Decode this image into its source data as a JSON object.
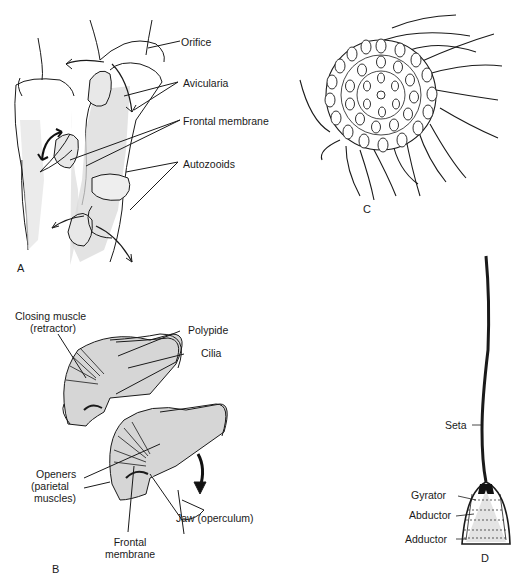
{
  "figure": {
    "panels": [
      {
        "id": "A",
        "letter": "A",
        "labels": {
          "orifice": "Orifice",
          "avicularia": "Avicularia",
          "frontal_membrane": "Frontal membrane",
          "autozooids": "Autozooids"
        }
      },
      {
        "id": "B",
        "letter": "B",
        "labels": {
          "closing_muscle_1": "Closing muscle",
          "closing_muscle_2": "(retractor)",
          "polypide": "Polypide",
          "cilia": "Cilia",
          "openers_1": "Openers",
          "openers_2": "(parietal",
          "openers_3": "muscles)",
          "frontal_membrane_1": "Frontal",
          "frontal_membrane_2": "membrane",
          "jaw": "Jaw (operculum)"
        }
      },
      {
        "id": "C",
        "letter": "C"
      },
      {
        "id": "D",
        "letter": "D",
        "labels": {
          "seta": "Seta",
          "gyrator": "Gyrator",
          "abductor": "Abductor",
          "adductor": "Adductor"
        }
      }
    ]
  },
  "colors": {
    "ink": "#1a1a1a",
    "shade": "#d4d4d4",
    "background": "#ffffff"
  }
}
